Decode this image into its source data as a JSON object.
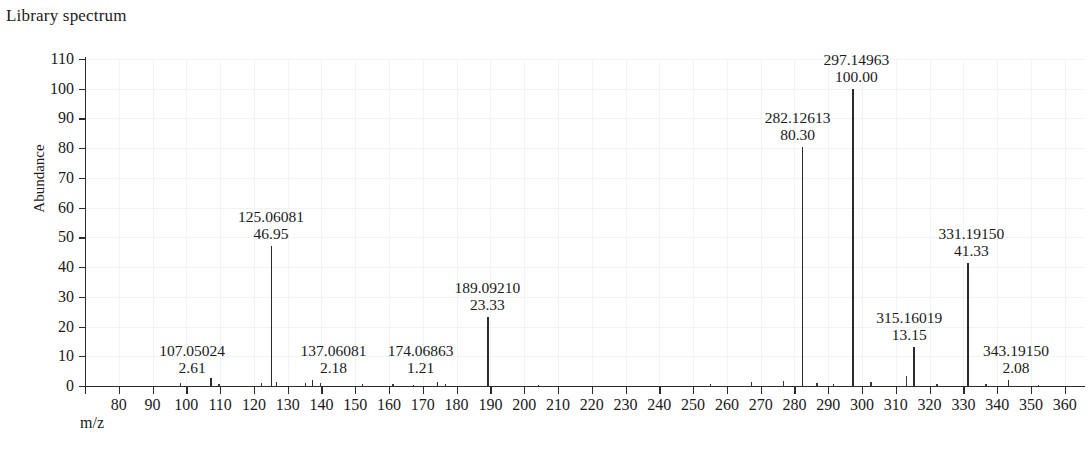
{
  "title": "Library spectrum",
  "axes": {
    "y_title": "Abundance",
    "x_title": "m/z"
  },
  "chart_data": {
    "type": "bar",
    "title": "Library spectrum",
    "xlabel": "m/z",
    "ylabel": "Abundance",
    "xlim": [
      70,
      366
    ],
    "ylim": [
      0,
      110
    ],
    "ytick_step": 10,
    "xtick_step": 10,
    "grid": "faint",
    "legend": "none",
    "x_ticks": [
      70,
      80,
      90,
      100,
      110,
      120,
      130,
      140,
      150,
      160,
      170,
      180,
      190,
      200,
      210,
      220,
      230,
      240,
      250,
      260,
      270,
      280,
      290,
      300,
      310,
      320,
      330,
      340,
      350,
      360
    ],
    "x_tick_labels": [
      "",
      "80",
      "90",
      "100",
      "110",
      "120",
      "130",
      "140",
      "150",
      "160",
      "170",
      "180",
      "190",
      "200",
      "210",
      "220",
      "230",
      "240",
      "250",
      "260",
      "270",
      "280",
      "290",
      "300",
      "310",
      "320",
      "330",
      "340",
      "350",
      "360"
    ],
    "y_ticks": [
      0,
      10,
      20,
      30,
      40,
      50,
      60,
      70,
      80,
      90,
      100,
      110
    ],
    "y_tick_labels": [
      "0",
      "10",
      "20",
      "30",
      "40",
      "50",
      "60",
      "70",
      "80",
      "90",
      "100",
      "110"
    ],
    "labeled_peaks": [
      {
        "mz": "107.05024",
        "abundance": "2.61",
        "x": 107.05024,
        "y": 2.61,
        "label_dx": -18,
        "label_side": "left"
      },
      {
        "mz": "125.06081",
        "abundance": "46.95",
        "x": 125.06081,
        "y": 46.95,
        "label_dx": 0,
        "label_side": "center"
      },
      {
        "mz": "137.06081",
        "abundance": "2.18",
        "x": 137.06081,
        "y": 2.18,
        "label_dx": 22,
        "label_side": "right"
      },
      {
        "mz": "174.06863",
        "abundance": "1.21",
        "x": 174.06863,
        "y": 1.21,
        "label_dx": -16,
        "label_side": "left"
      },
      {
        "mz": "189.09210",
        "abundance": "23.33",
        "x": 189.0921,
        "y": 23.33,
        "label_dx": 0,
        "label_side": "center"
      },
      {
        "mz": "282.12613",
        "abundance": "80.30",
        "x": 282.12613,
        "y": 80.3,
        "label_dx": -4,
        "label_side": "center"
      },
      {
        "mz": "297.14963",
        "abundance": "100.00",
        "x": 297.14963,
        "y": 100.0,
        "label_dx": 4,
        "label_side": "center"
      },
      {
        "mz": "315.16019",
        "abundance": "13.15",
        "x": 315.16019,
        "y": 13.15,
        "label_dx": -4,
        "label_side": "center"
      },
      {
        "mz": "331.19150",
        "abundance": "41.33",
        "x": 331.1915,
        "y": 41.33,
        "label_dx": 4,
        "label_side": "center"
      },
      {
        "mz": "343.19150",
        "abundance": "2.08",
        "x": 343.1915,
        "y": 2.08,
        "label_dx": 8,
        "label_side": "right"
      }
    ],
    "minor_peaks": [
      {
        "x": 98.0,
        "y": 0.9
      },
      {
        "x": 109.5,
        "y": 0.7
      },
      {
        "x": 122.0,
        "y": 1.0
      },
      {
        "x": 126.5,
        "y": 1.4
      },
      {
        "x": 135.0,
        "y": 1.1
      },
      {
        "x": 139.5,
        "y": 0.9
      },
      {
        "x": 152.0,
        "y": 0.6
      },
      {
        "x": 161.0,
        "y": 0.8
      },
      {
        "x": 167.0,
        "y": 0.5
      },
      {
        "x": 176.5,
        "y": 0.7
      },
      {
        "x": 204.0,
        "y": 0.5
      },
      {
        "x": 255.0,
        "y": 0.6
      },
      {
        "x": 267.0,
        "y": 1.3
      },
      {
        "x": 276.5,
        "y": 1.6
      },
      {
        "x": 286.5,
        "y": 1.0
      },
      {
        "x": 291.5,
        "y": 0.8
      },
      {
        "x": 302.5,
        "y": 1.4
      },
      {
        "x": 313.0,
        "y": 3.4
      },
      {
        "x": 322.0,
        "y": 0.7
      },
      {
        "x": 336.5,
        "y": 0.6
      },
      {
        "x": 352.0,
        "y": 0.5
      }
    ],
    "base_peak_mz": "297.14963",
    "base_peak_abundance": "100.00"
  }
}
